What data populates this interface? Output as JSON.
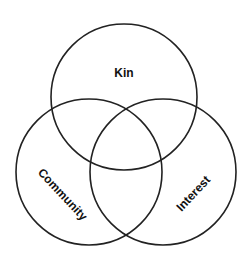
{
  "diagram": {
    "type": "venn",
    "sets": [
      {
        "id": "kin",
        "label": "Kin",
        "cx": 124,
        "cy": 97,
        "r": 73,
        "label_x": 124,
        "label_y": 74,
        "label_rotate": 0
      },
      {
        "id": "community",
        "label": "Community",
        "cx": 89,
        "cy": 172,
        "r": 73,
        "label_x": 62,
        "label_y": 195,
        "label_rotate": 47
      },
      {
        "id": "interest",
        "label": "Interest",
        "cx": 163,
        "cy": 172,
        "r": 73,
        "label_x": 194,
        "label_y": 194,
        "label_rotate": -47
      }
    ],
    "stroke_color": "#222222",
    "label_color": "#111111",
    "background": "#ffffff"
  }
}
